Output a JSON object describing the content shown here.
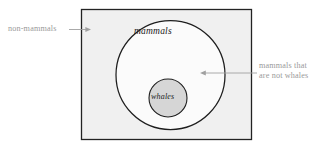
{
  "diagram": {
    "type": "euler-venn-nested-sets",
    "universe": {
      "name": "universe-rectangle",
      "fill_color": "#f0f0f0",
      "stroke_color": "#232323"
    },
    "sets": [
      {
        "id": "mammals",
        "label": "mammals",
        "shape": "circle",
        "fill_color": "#fbfbfb",
        "stroke_color": "#1e1e1e"
      },
      {
        "id": "whales",
        "label": "whales",
        "shape": "circle",
        "fill_color": "#d6d6d6",
        "stroke_color": "#1e1e1e"
      }
    ],
    "annotations": [
      {
        "id": "non-mammals",
        "text": "non-mammals",
        "color": "#9a9a9a",
        "arrow_direction": "right",
        "points_to": "universe-rectangle"
      },
      {
        "id": "mammals-not-whales",
        "line1": "mammals that",
        "line2": "are not whales",
        "color": "#9a9a9a",
        "arrow_direction": "left",
        "points_to": "mammals"
      }
    ]
  }
}
